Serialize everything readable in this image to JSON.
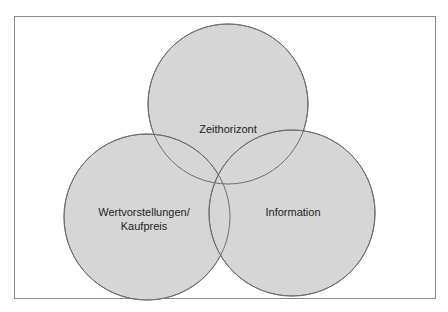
{
  "diagram": {
    "type": "venn",
    "circles": [
      {
        "id": "top",
        "label": "Zeithorizont",
        "cx": 228,
        "cy": 104,
        "r": 80
      },
      {
        "id": "bottom-left",
        "label_line1": "Wertvorstellungen/",
        "label_line2": "Kaufpreis",
        "cx": 147,
        "cy": 217,
        "r": 83
      },
      {
        "id": "bottom-right",
        "label": "Information",
        "cx": 292,
        "cy": 213,
        "r": 83
      }
    ],
    "colors": {
      "fill": "#d6d6d6",
      "stroke": "#6e6e6e",
      "frame": "#8a8a8a"
    }
  }
}
